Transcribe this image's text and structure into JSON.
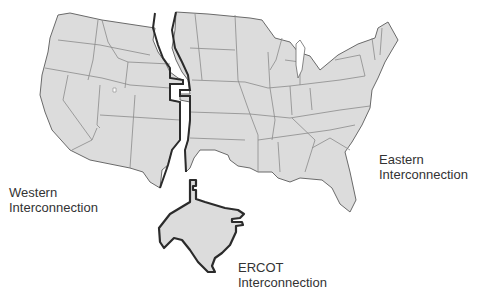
{
  "map": {
    "subject": "United States electric power grid interconnections",
    "colors": {
      "background": "#ffffff",
      "land_fill": "#dcdcdc",
      "state_border": "#6a6a6a",
      "interconnection_border": "#2b2b2b",
      "label_text": "#333333"
    },
    "regions": [
      {
        "id": "western",
        "line1": "Western",
        "line2": "Interconnection"
      },
      {
        "id": "eastern",
        "line1": "Eastern",
        "line2": "Interconnection"
      },
      {
        "id": "ercot",
        "line1": "ERCOT",
        "line2": "Interconnection"
      }
    ]
  }
}
